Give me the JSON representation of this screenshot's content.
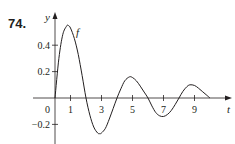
{
  "problem": {
    "number": "74."
  },
  "chart_data": {
    "type": "line",
    "title": "",
    "xlabel": "t",
    "ylabel": "y",
    "curve_label": "f",
    "xlim": [
      0,
      11
    ],
    "ylim": [
      -0.3,
      0.65
    ],
    "grid": false,
    "legend": "none",
    "x_ticks": [
      1,
      3,
      5,
      7,
      9
    ],
    "x_tick_labels": [
      "1",
      "3",
      "5",
      "7",
      "9"
    ],
    "y_ticks": [
      0.4,
      0.2,
      -0.2
    ],
    "y_tick_labels": [
      "0.4",
      "0.2",
      "−0.2"
    ],
    "origin_label": "0",
    "series": [
      {
        "name": "f",
        "x": [
          0,
          0.25,
          0.5,
          0.75,
          0.85,
          1.0,
          1.25,
          1.5,
          1.75,
          2.0,
          2.25,
          2.5,
          2.75,
          2.9,
          3.0,
          3.25,
          3.5,
          3.75,
          4.0,
          4.25,
          4.5,
          4.8,
          5.0,
          5.25,
          5.5,
          5.75,
          6.0,
          6.25,
          6.5,
          6.75,
          7.0,
          7.25,
          7.5,
          7.75,
          8.0,
          8.25,
          8.5,
          8.7,
          9.0,
          9.25,
          9.5,
          9.75,
          10.0
        ],
        "y": [
          0,
          0.3,
          0.48,
          0.545,
          0.55,
          0.53,
          0.45,
          0.33,
          0.17,
          0,
          -0.13,
          -0.22,
          -0.265,
          -0.27,
          -0.265,
          -0.23,
          -0.16,
          -0.08,
          0,
          0.07,
          0.13,
          0.16,
          0.155,
          0.13,
          0.09,
          0.045,
          0,
          -0.06,
          -0.11,
          -0.135,
          -0.14,
          -0.125,
          -0.095,
          -0.05,
          0,
          0.05,
          0.085,
          0.1,
          0.095,
          0.075,
          0.05,
          0.025,
          0
        ]
      }
    ]
  },
  "colors": {
    "ink": "#231f20",
    "background": "#ffffff"
  }
}
